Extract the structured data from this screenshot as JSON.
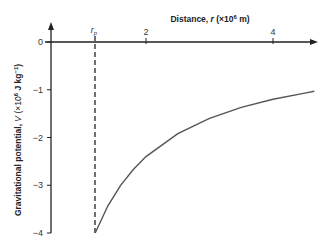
{
  "chart_data": {
    "type": "line",
    "title": "",
    "xlabel": "Distance, r (×10⁶ m)",
    "ylabel": "Gravitational potential, V (×10⁶ J kg⁻¹)",
    "x_ticks": [
      {
        "value": 2,
        "label": "2"
      },
      {
        "value": 4,
        "label": "4"
      }
    ],
    "y_ticks": [
      {
        "value": 0,
        "label": "0"
      },
      {
        "value": -1,
        "label": "−1"
      },
      {
        "value": -2,
        "label": "−2"
      },
      {
        "value": -3,
        "label": "−3"
      },
      {
        "value": -4,
        "label": "−4"
      }
    ],
    "annotation": {
      "label": "r",
      "subscript": "p",
      "x": 1.2
    },
    "xlim": [
      0.5,
      4.8
    ],
    "ylim": [
      -4,
      0
    ],
    "grid": false,
    "series": [
      {
        "name": "V(r)",
        "x": [
          1.2,
          1.4,
          1.6,
          1.8,
          2.0,
          2.5,
          3.0,
          3.5,
          4.0,
          4.5,
          4.65
        ],
        "values": [
          -4.0,
          -3.43,
          -3.0,
          -2.67,
          -2.4,
          -1.92,
          -1.6,
          -1.37,
          -1.2,
          -1.07,
          -1.03
        ]
      }
    ]
  }
}
